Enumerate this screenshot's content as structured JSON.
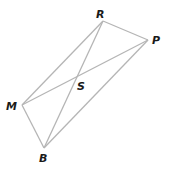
{
  "diagram": {
    "type": "quadrilateral-with-diagonals",
    "vertices": [
      {
        "id": "R",
        "label": "R"
      },
      {
        "id": "P",
        "label": "P"
      },
      {
        "id": "B",
        "label": "B"
      },
      {
        "id": "M",
        "label": "M"
      }
    ],
    "intersection": {
      "id": "S",
      "label": "S"
    },
    "sides": [
      [
        "R",
        "P"
      ],
      [
        "P",
        "B"
      ],
      [
        "B",
        "M"
      ],
      [
        "M",
        "R"
      ]
    ],
    "diagonals": [
      [
        "R",
        "B"
      ],
      [
        "M",
        "P"
      ]
    ],
    "line_color": "#b5b5b5",
    "label_color": "#1a1a1a"
  }
}
